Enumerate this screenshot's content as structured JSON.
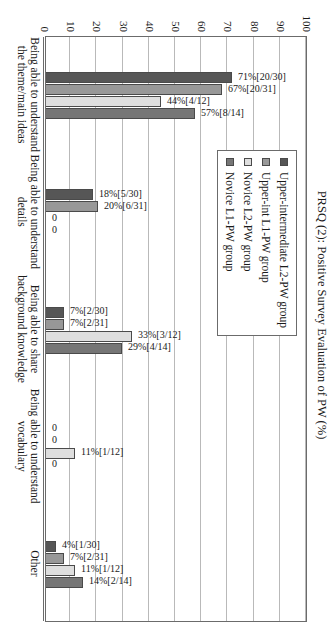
{
  "chart_data": {
    "type": "bar",
    "title": "",
    "xlabel": "",
    "ylabel": "PRSQ (2): Positive Survey Evaluation of PW (%)",
    "ylim": [
      0,
      100
    ],
    "ytick_step": 10,
    "yticks": [
      "0",
      "10",
      "20",
      "30",
      "40",
      "50",
      "60",
      "70",
      "80",
      "90",
      "100"
    ],
    "grid": true,
    "legend_position": "upper-center",
    "orientation": "vertical-bars-rotated-page",
    "categories": [
      "Being able to understand the theme/main ideas",
      "Being able to understand details",
      "Being able to share background knowledge",
      "Being able to understand vocabulary",
      "Other"
    ],
    "series": [
      {
        "name": "Upper-intermediate L2-PW group",
        "color": "#565656",
        "values": [
          71,
          18,
          7,
          0,
          4
        ],
        "labels": [
          "71%[20/30]",
          "18%[5/30]",
          "7%[2/30]",
          "0",
          "4%[1/30]"
        ]
      },
      {
        "name": "Upper-int L1-PW group",
        "color": "#989898",
        "values": [
          67,
          20,
          7,
          0,
          7
        ],
        "labels": [
          "67%[20/31]",
          "20%[6/31]",
          "7%[2/31]",
          "0",
          "7%[2/31]"
        ]
      },
      {
        "name": "Novice L2-PW group",
        "color": "#dedede",
        "values": [
          44,
          0,
          33,
          11,
          11
        ],
        "labels": [
          "44%[4/12]",
          "0",
          "33%[3/12]",
          "11%[1/12]",
          "11%[1/12]"
        ]
      },
      {
        "name": "Novice L1-PW group",
        "color": "#767676",
        "values": [
          57,
          0,
          29,
          0,
          14
        ],
        "labels": [
          "57%[8/14]",
          "0",
          "29%[4/14]",
          "0",
          "14%[2/14]"
        ]
      }
    ]
  },
  "legend": {
    "items": [
      {
        "label": "Upper-intermediate L2-PW group"
      },
      {
        "label": "Upper-int L1-PW group"
      },
      {
        "label": "Novice L2-PW group"
      },
      {
        "label": "Novice L1-PW group"
      }
    ]
  }
}
